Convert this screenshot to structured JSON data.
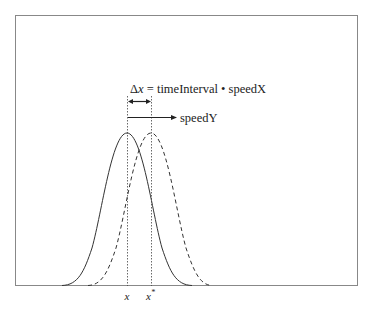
{
  "diagram": {
    "equation": {
      "delta_symbol": "Δ",
      "delta_var": "x",
      "rest": " = timeInterval • speedX"
    },
    "speed_label": "speedY",
    "x_label": "x",
    "x_star_label": "x",
    "x_star_superscript": "*",
    "curves": [
      {
        "name": "original",
        "style": "solid",
        "peak_x": 127
      },
      {
        "name": "shifted",
        "style": "dashed",
        "peak_x": 151
      }
    ],
    "colors": {
      "line": "#333333",
      "frame": "#888888",
      "text": "#222222"
    }
  }
}
